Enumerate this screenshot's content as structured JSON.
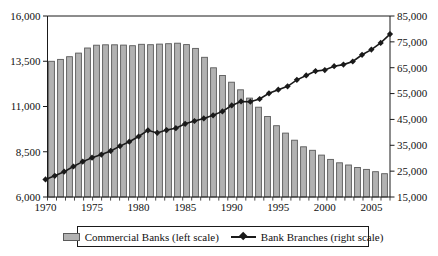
{
  "chart_data": {
    "type": "bar",
    "subtype": "combo-bar-line-dual-axis",
    "title": "",
    "categories": [
      1970,
      1971,
      1972,
      1973,
      1974,
      1975,
      1976,
      1977,
      1978,
      1979,
      1980,
      1981,
      1982,
      1983,
      1984,
      1985,
      1986,
      1987,
      1988,
      1989,
      1990,
      1991,
      1992,
      1993,
      1994,
      1995,
      1996,
      1997,
      1998,
      1999,
      2000,
      2001,
      2002,
      2003,
      2004,
      2005,
      2006,
      2007
    ],
    "series": [
      {
        "name": "Commercial Banks (left scale)",
        "type": "bar",
        "axis": "left",
        "values": [
          13500,
          13600,
          13750,
          13950,
          14230,
          14385,
          14410,
          14410,
          14390,
          14360,
          14435,
          14415,
          14450,
          14470,
          14495,
          14420,
          14210,
          13720,
          13140,
          12715,
          12345,
          11925,
          11465,
          10960,
          10450,
          9940,
          9530,
          9140,
          8775,
          8580,
          8315,
          8080,
          7890,
          7770,
          7630,
          7525,
          7400,
          7285
        ]
      },
      {
        "name": "Bank Branches (right scale)",
        "type": "line",
        "axis": "right",
        "marker": "diamond",
        "values": [
          21800,
          23200,
          24800,
          26800,
          28700,
          30200,
          31400,
          32800,
          34700,
          36400,
          38400,
          40800,
          39800,
          40900,
          41600,
          43300,
          44400,
          45400,
          46600,
          48100,
          50400,
          51950,
          51850,
          52900,
          55100,
          56500,
          57800,
          60300,
          62000,
          63700,
          64100,
          65600,
          66200,
          67400,
          70000,
          72000,
          74600,
          78000
        ]
      }
    ],
    "left_axis": {
      "min": 6000,
      "max": 16000,
      "tick_values": [
        16000,
        13500,
        11000,
        8500,
        6000
      ],
      "tick_labels": [
        "16,000",
        "13,500",
        "11,000",
        "8,500",
        "6,000"
      ]
    },
    "right_axis": {
      "min": 15000,
      "max": 85000,
      "tick_values": [
        85000,
        75000,
        65000,
        55000,
        45000,
        35000,
        25000,
        15000
      ],
      "tick_labels": [
        "85,000",
        "75,000",
        "65,000",
        "55,000",
        "45,000",
        "35,000",
        "25,000",
        "15,000"
      ]
    },
    "x_axis": {
      "tick_years": [
        1970,
        1975,
        1980,
        1985,
        1990,
        1995,
        2000,
        2005
      ],
      "tick_labels": [
        "1970",
        "1975",
        "1980",
        "1985",
        "1990",
        "1995",
        "2000",
        "2005"
      ]
    },
    "legend": [
      {
        "label": "Commercial Banks (left scale)",
        "marker": "bar-swatch",
        "color": "#b2b2b2"
      },
      {
        "label": "Bank Branches (right scale)",
        "marker": "line-diamond",
        "color": "#1a1a1a"
      }
    ],
    "layout": {
      "grid": "off",
      "legend_position": "bottom"
    },
    "colors": {
      "bar_fill": "#b2b2b2",
      "bar_stroke": "#5a5a5a",
      "line": "#1a1a1a",
      "axis": "#1a1a1a",
      "background": "#ffffff"
    }
  }
}
